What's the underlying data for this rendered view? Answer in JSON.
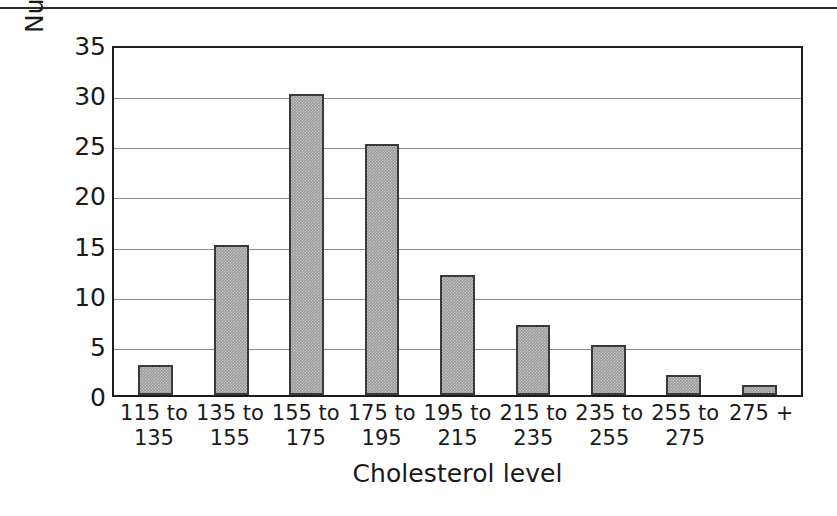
{
  "figure": {
    "top_rule": true,
    "frame_color": "#1d1d1d",
    "bar_fill": "#9c9c9c",
    "bar_border": "#3a3a3a",
    "gridline_color": "#8d8d8d"
  },
  "chart_data": {
    "type": "bar",
    "title": "",
    "xlabel": "Cholesterol level",
    "ylabel": "Number of subjects",
    "categories": [
      "115 to\n135",
      "135 to\n155",
      "155 to\n175",
      "175 to\n195",
      "195 to\n215",
      "215 to\n235",
      "235 to\n255",
      "255 to\n275",
      "275 +"
    ],
    "values": [
      3,
      15,
      30,
      25,
      12,
      7,
      5,
      2,
      1
    ],
    "ylim": [
      0,
      35
    ],
    "ytick_step": 5,
    "yticks": [
      35,
      30,
      25,
      20,
      15,
      10,
      5,
      0
    ],
    "grid": "horizontal",
    "legend": "none"
  }
}
